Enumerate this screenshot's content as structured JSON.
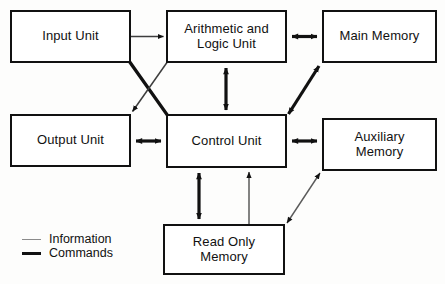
{
  "diagram": {
    "nodes": [
      {
        "id": "input-unit",
        "label": "Input Unit",
        "x": 10,
        "y": 10,
        "w": 121,
        "h": 53
      },
      {
        "id": "alu",
        "label": "Arithmetic and\nLogic Unit",
        "x": 166,
        "y": 10,
        "w": 121,
        "h": 53
      },
      {
        "id": "main-memory",
        "label": "Main Memory",
        "x": 322,
        "y": 10,
        "w": 115,
        "h": 53
      },
      {
        "id": "output-unit",
        "label": "Output Unit",
        "x": 10,
        "y": 114,
        "w": 121,
        "h": 53
      },
      {
        "id": "control-unit",
        "label": "Control Unit",
        "x": 166,
        "y": 114,
        "w": 121,
        "h": 54
      },
      {
        "id": "auxiliary-memory",
        "label": "Auxiliary\nMemory",
        "x": 322,
        "y": 118,
        "w": 115,
        "h": 53
      },
      {
        "id": "read-only-memory",
        "label": "Read Only\nMemory",
        "x": 163,
        "y": 224,
        "w": 122,
        "h": 51
      }
    ],
    "connections": [
      {
        "id": "input-to-alu",
        "from": "input-unit",
        "to": "alu",
        "kind": "information",
        "arrows": "one-way"
      },
      {
        "id": "input-to-control",
        "from": "input-unit",
        "to": "control-unit",
        "kind": "commands",
        "arrows": "none"
      },
      {
        "id": "alu-to-output",
        "from": "alu",
        "to": "output-unit",
        "kind": "information",
        "arrows": "one-way"
      },
      {
        "id": "alu-to-main-memory",
        "from": "alu",
        "to": "main-memory",
        "kind": "commands",
        "arrows": "two-way"
      },
      {
        "id": "alu-to-control",
        "from": "alu",
        "to": "control-unit",
        "kind": "commands",
        "arrows": "two-way"
      },
      {
        "id": "control-to-main-memory",
        "from": "control-unit",
        "to": "main-memory",
        "kind": "commands",
        "arrows": "two-way"
      },
      {
        "id": "output-to-control",
        "from": "output-unit",
        "to": "control-unit",
        "kind": "commands",
        "arrows": "two-way"
      },
      {
        "id": "control-to-auxiliary",
        "from": "control-unit",
        "to": "auxiliary-memory",
        "kind": "commands",
        "arrows": "two-way"
      },
      {
        "id": "control-to-rom-commands",
        "from": "control-unit",
        "to": "read-only-memory",
        "kind": "commands",
        "arrows": "two-way"
      },
      {
        "id": "rom-to-control-info",
        "from": "read-only-memory",
        "to": "control-unit",
        "kind": "information",
        "arrows": "one-way"
      },
      {
        "id": "rom-to-auxiliary",
        "from": "read-only-memory",
        "to": "auxiliary-memory",
        "kind": "information",
        "arrows": "two-way"
      }
    ],
    "legend": {
      "items": [
        {
          "id": "legend-information",
          "label": "Information",
          "style": "thin-gray-line",
          "color": "#8b8b8b"
        },
        {
          "id": "legend-commands",
          "label": "Commands",
          "style": "thick-black-line",
          "color": "#111111"
        }
      ]
    },
    "colors": {
      "box_border": "#111111",
      "box_fill": "#ffffff",
      "information_line": "#8b8b8b",
      "commands_line": "#111111",
      "background": "#fdfdfc",
      "text": "#111111"
    }
  }
}
